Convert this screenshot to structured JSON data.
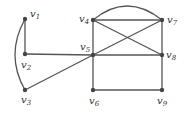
{
  "diagram": {
    "type": "graph",
    "nodes": [
      {
        "id": "v1",
        "label": "v",
        "sub": "1",
        "x": 25,
        "y": 19,
        "lx": 30,
        "ly": 17
      },
      {
        "id": "v2",
        "label": "v",
        "sub": "2",
        "x": 25,
        "y": 54,
        "lx": 21,
        "ly": 68
      },
      {
        "id": "v3",
        "label": "v",
        "sub": "3",
        "x": 25,
        "y": 90,
        "lx": 21,
        "ly": 103
      },
      {
        "id": "v4",
        "label": "v",
        "sub": "4",
        "x": 93,
        "y": 20,
        "lx": 78,
        "ly": 22
      },
      {
        "id": "v5",
        "label": "v",
        "sub": "5",
        "x": 93,
        "y": 55,
        "lx": 80,
        "ly": 50
      },
      {
        "id": "v6",
        "label": "v",
        "sub": "6",
        "x": 93,
        "y": 90,
        "lx": 89,
        "ly": 104
      },
      {
        "id": "v7",
        "label": "v",
        "sub": "7",
        "x": 162,
        "y": 20,
        "lx": 167,
        "ly": 23
      },
      {
        "id": "v8",
        "label": "v",
        "sub": "8",
        "x": 162,
        "y": 55,
        "lx": 166,
        "ly": 58
      },
      {
        "id": "v9",
        "label": "v",
        "sub": "9",
        "x": 162,
        "y": 90,
        "lx": 158,
        "ly": 104
      }
    ],
    "edges": [
      [
        "v1",
        "v2"
      ],
      [
        "v1",
        "v3"
      ],
      [
        "v2",
        "v5"
      ],
      [
        "v3",
        "v5"
      ],
      [
        "v4",
        "v5"
      ],
      [
        "v5",
        "v6"
      ],
      [
        "v4",
        "v7"
      ],
      [
        "v4",
        "v7"
      ],
      [
        "v4",
        "v8"
      ],
      [
        "v5",
        "v7"
      ],
      [
        "v5",
        "v8"
      ],
      [
        "v7",
        "v8"
      ],
      [
        "v8",
        "v9"
      ],
      [
        "v6",
        "v9"
      ]
    ]
  }
}
